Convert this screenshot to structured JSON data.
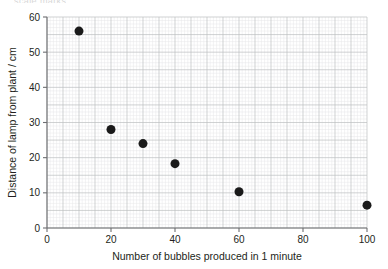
{
  "header": {
    "clipped_text": "scale marks"
  },
  "chart_data": {
    "type": "scatter",
    "title": "",
    "xlabel": "Number of bubbles produced in 1 minute",
    "ylabel": "Distance of lamp from plant / cm",
    "xlim": [
      0,
      100
    ],
    "ylim": [
      0,
      60
    ],
    "xticks": [
      0,
      20,
      40,
      60,
      80,
      100
    ],
    "yticks": [
      0,
      10,
      20,
      30,
      40,
      50,
      60
    ],
    "xtick_labels": [
      "0",
      "20",
      "40",
      "60",
      "80",
      "100"
    ],
    "ytick_labels": [
      "0",
      "10",
      "20",
      "30",
      "40",
      "50",
      "60"
    ],
    "x_minor_step": 1,
    "y_minor_step": 1,
    "x_major_step": 5,
    "y_major_step": 5,
    "grid": true,
    "legend": false,
    "marker": "filled-circle",
    "marker_color": "#1a1a1a",
    "marker_size": 9,
    "points": [
      {
        "x": 10,
        "y": 56.0
      },
      {
        "x": 20,
        "y": 28.0
      },
      {
        "x": 30,
        "y": 24.0
      },
      {
        "x": 40,
        "y": 18.3
      },
      {
        "x": 60,
        "y": 10.3
      },
      {
        "x": 100,
        "y": 6.5
      }
    ],
    "colors": {
      "axis": "#6d6e71",
      "grid_minor": "#e6e7e8",
      "grid_major": "#bcbec0",
      "marker": "#1a1a1a",
      "text": "#231f20"
    }
  }
}
